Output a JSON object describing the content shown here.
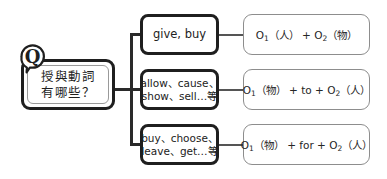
{
  "diagram": {
    "type": "mind-map",
    "root": {
      "badge": "Q",
      "line1": "授與動詞",
      "line2": "有哪些？"
    },
    "branches": [
      {
        "verbs_line1": "give, buy",
        "verbs_line2": "",
        "pattern": {
          "o1": "O",
          "o1_sub": "1",
          "o1_obj": "（人）",
          "operator": "+",
          "preposition": "",
          "o2": "O",
          "o2_sub": "2",
          "o2_obj": "（物）",
          "full": "O1（人）+ O2（物）"
        }
      },
      {
        "verbs_line1": "allow、cause、",
        "verbs_line2": "show、sell…等",
        "pattern": {
          "o1": "O",
          "o1_sub": "1",
          "o1_obj": "（物）",
          "operator": "+",
          "preposition": "to",
          "o2": "O",
          "o2_sub": "2",
          "o2_obj": "（人）",
          "full": "O1（物）+ to + O2（人）"
        }
      },
      {
        "verbs_line1": "buy、choose、",
        "verbs_line2": "leave、get…等",
        "pattern": {
          "o1": "O",
          "o1_sub": "1",
          "o1_obj": "（物）",
          "operator": "+",
          "preposition": "for",
          "o2": "O",
          "o2_sub": "2",
          "o2_obj": "（人）",
          "full": "O1（物）+ for + O2（人）"
        }
      }
    ],
    "colors": {
      "background": "#ffffff",
      "thick_border": "#1f1f1f",
      "thin_border": "#8d8d8d",
      "connector": "#2a2a2a",
      "text": "#222222"
    }
  }
}
